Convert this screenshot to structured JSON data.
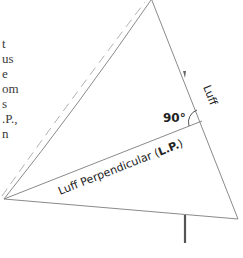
{
  "text_fragments": [
    "t",
    "us",
    "e",
    "om",
    "s",
    ".P.,",
    "n"
  ],
  "labels": {
    "luff": "Luff",
    "angle": "90°",
    "luff_perpendicular": "Luff Perpendicular (",
    "lp_bold": "L.P.",
    "lp_close": ")"
  },
  "colors": {
    "line": "#8a8a8a",
    "dashed": "#b0b0b0",
    "post": "#555555",
    "text": "#222222"
  }
}
